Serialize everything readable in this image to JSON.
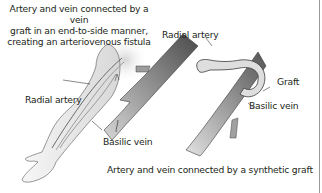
{
  "figure": {
    "left_panel": {
      "caption_lines": [
        "Artery and vein connected by a vein",
        "graft in an end-to-side manner,",
        "creating an arteriovenous fistula"
      ],
      "labels": {
        "radial_artery": "Radial artery",
        "basilic_vein": "Basilic vein"
      }
    },
    "right_panel": {
      "labels": {
        "radial_artery": "Radial artery",
        "graft": "Graft",
        "basilic_vein": "Basilic vein"
      },
      "caption": "Artery and vein connected by a synthetic graft"
    },
    "colors": {
      "vessel_dark": "#5f5f5f",
      "vessel_light": "#b8b8b8",
      "graft_fill": "#dcdcdc",
      "skin_fill": "#ececec",
      "outline": "#3a3a3a",
      "border": "#9a9a9a"
    }
  }
}
